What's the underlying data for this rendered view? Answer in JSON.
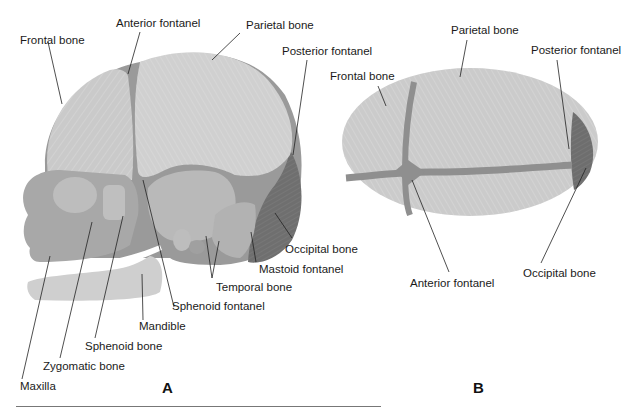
{
  "figure": {
    "panels": [
      {
        "id": "A",
        "letter": "A",
        "view": "lateral",
        "labels": {
          "frontal_bone": "Frontal bone",
          "anterior_fontanel": "Anterior fontanel",
          "parietal_bone": "Parietal bone",
          "posterior_fontanel": "Posterior fontanel",
          "occipital_bone": "Occipital bone",
          "mastoid_fontanel": "Mastoid fontanel",
          "temporal_bone": "Temporal bone",
          "sphenoid_fontanel": "Sphenoid fontanel",
          "mandible": "Mandible",
          "sphenoid_bone": "Sphenoid bone",
          "zygomatic_bone": "Zygomatic bone",
          "maxilla": "Maxilla"
        }
      },
      {
        "id": "B",
        "letter": "B",
        "view": "superior",
        "labels": {
          "parietal_bone": "Parietal bone",
          "posterior_fontanel": "Posterior fontanel",
          "frontal_bone": "Frontal bone",
          "anterior_fontanel": "Anterior fontanel",
          "occipital_bone": "Occipital bone"
        }
      }
    ],
    "colors": {
      "bone": "#c9c9c9",
      "bone_light": "#d4d4d4",
      "fontanel": "#8f8f8f",
      "occipital": "#6e6e6e",
      "face": "#a9a9a9",
      "line": "#222222"
    }
  }
}
